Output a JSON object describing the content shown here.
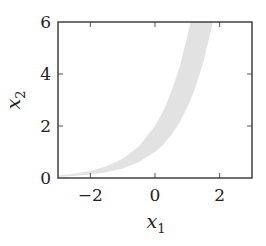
{
  "chart_data": {
    "type": "area",
    "title": "",
    "xlabel": "x1",
    "ylabel": "x2",
    "xlabel_main": "x",
    "xlabel_sub": "1",
    "ylabel_main": "x",
    "ylabel_sub": "2",
    "xlim": [
      -3,
      3
    ],
    "ylim": [
      0,
      6
    ],
    "grid": false,
    "legend": null,
    "xticks": [
      -2,
      0,
      2
    ],
    "yticks": [
      0,
      2,
      4,
      6
    ],
    "xtick_labels": [
      "−2",
      "0",
      "2"
    ],
    "ytick_labels": [
      "0",
      "2",
      "4",
      "6"
    ],
    "series": [
      {
        "name": "band",
        "kind": "fill_between",
        "description": "shaded region between x2 = exp(x1) and x2 = 2*exp(x1)",
        "x": [
          -3.0,
          -2.5,
          -2.0,
          -1.5,
          -1.0,
          -0.5,
          0.0,
          0.25,
          0.5,
          0.75,
          1.0,
          1.1,
          1.25,
          1.5,
          1.79
        ],
        "lower": [
          0.05,
          0.08,
          0.14,
          0.22,
          0.37,
          0.61,
          1.0,
          1.28,
          1.65,
          2.12,
          2.72,
          3.0,
          3.49,
          4.48,
          6.0
        ],
        "upper": [
          0.1,
          0.16,
          0.27,
          0.45,
          0.74,
          1.21,
          2.0,
          2.57,
          3.3,
          4.23,
          5.44,
          6.0,
          6.0,
          6.0,
          6.0
        ],
        "color": "#e2e2e2"
      }
    ]
  },
  "style": {
    "frame_color": "#333333",
    "tick_color": "#555555",
    "band_color": "#e2e2e2"
  }
}
